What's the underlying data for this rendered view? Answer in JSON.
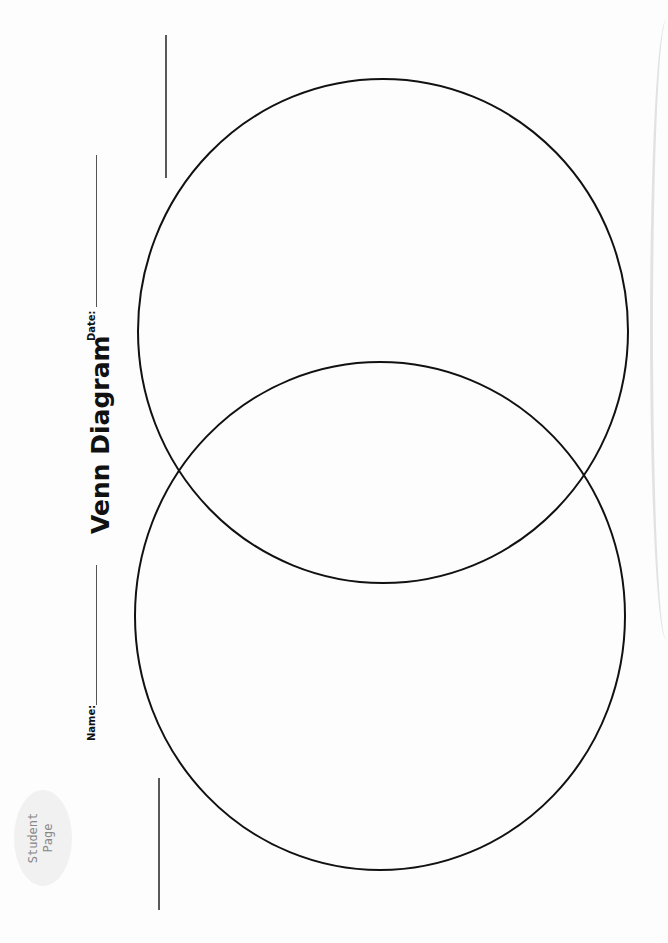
{
  "worksheet": {
    "title": "Venn Diagram",
    "badge": {
      "line1": "Student",
      "line2": "Page"
    },
    "fields": [
      {
        "label": "Name:",
        "value": ""
      },
      {
        "label": "Date:",
        "value": ""
      }
    ],
    "diagram": {
      "type": "venn",
      "circles": 2,
      "stroke_color": "#111111",
      "regions": [
        "circle-a",
        "overlap",
        "circle-b"
      ]
    }
  }
}
